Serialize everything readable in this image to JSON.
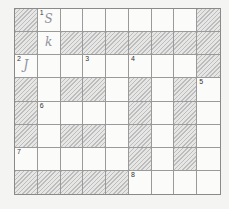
{
  "puzzle": {
    "type": "crossword",
    "cols": 9,
    "rows": 8,
    "colors": {
      "shaded_stripe": "#bdbdbd",
      "shaded_bg": "#e6e6e4",
      "grid_line": "#9a9a9a",
      "cell_bg": "#fbfbfa"
    },
    "grid": [
      [
        1,
        0,
        0,
        0,
        0,
        0,
        0,
        0,
        1
      ],
      [
        1,
        0,
        1,
        1,
        1,
        1,
        1,
        1,
        1
      ],
      [
        0,
        0,
        0,
        0,
        0,
        0,
        0,
        0,
        1
      ],
      [
        1,
        0,
        1,
        1,
        0,
        1,
        0,
        1,
        0
      ],
      [
        1,
        0,
        0,
        0,
        0,
        1,
        0,
        1,
        0
      ],
      [
        1,
        0,
        1,
        1,
        0,
        1,
        0,
        1,
        0
      ],
      [
        0,
        0,
        0,
        0,
        0,
        1,
        0,
        1,
        0
      ],
      [
        1,
        1,
        1,
        1,
        1,
        0,
        0,
        0,
        0
      ]
    ],
    "numbers": [
      {
        "row": 0,
        "col": 1,
        "label": "1"
      },
      {
        "row": 2,
        "col": 0,
        "label": "2"
      },
      {
        "row": 2,
        "col": 3,
        "label": "3"
      },
      {
        "row": 2,
        "col": 5,
        "label": "4"
      },
      {
        "row": 3,
        "col": 8,
        "label": "5"
      },
      {
        "row": 4,
        "col": 1,
        "label": "6"
      },
      {
        "row": 6,
        "col": 0,
        "label": "7"
      },
      {
        "row": 7,
        "col": 5,
        "label": "8"
      }
    ],
    "entries": [
      {
        "row": 0,
        "col": 1,
        "text": "S"
      },
      {
        "row": 1,
        "col": 1,
        "text": "k"
      },
      {
        "row": 2,
        "col": 0,
        "text": "J"
      }
    ]
  }
}
